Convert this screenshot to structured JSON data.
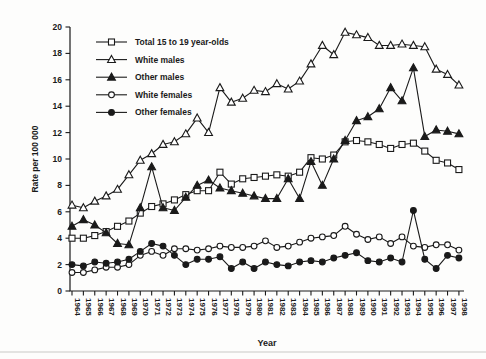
{
  "figure": {
    "ylabel": "Rate per 100 000",
    "xlabel": "Year",
    "background": "#fdfdfc",
    "ink_color": "#1a1a1a",
    "page_rule_color": "#c9c9c5"
  },
  "chart_data": {
    "type": "line",
    "title": "",
    "xlabel": "Year",
    "ylabel": "Rate per 100 000",
    "ylim": [
      0,
      20
    ],
    "y_tick_step": 2,
    "grid": false,
    "legend_position": "upper-left-inside",
    "x": [
      1964,
      1965,
      1966,
      1967,
      1968,
      1969,
      1970,
      1971,
      1972,
      1973,
      1974,
      1975,
      1976,
      1977,
      1978,
      1979,
      1980,
      1981,
      1982,
      1983,
      1984,
      1985,
      1986,
      1987,
      1988,
      1989,
      1990,
      1991,
      1992,
      1993,
      1994,
      1995,
      1996,
      1997,
      1998
    ],
    "series": [
      {
        "id": "total",
        "name": "Total 15 to 19 year-olds",
        "marker": "open-square",
        "values": [
          4.0,
          4.0,
          4.2,
          4.5,
          4.9,
          5.3,
          5.9,
          6.4,
          6.6,
          6.9,
          7.3,
          7.6,
          7.6,
          9.0,
          8.1,
          8.5,
          8.6,
          8.7,
          8.8,
          8.7,
          9.0,
          10.1,
          10.0,
          10.3,
          11.3,
          11.4,
          11.3,
          11.1,
          10.8,
          11.1,
          11.2,
          10.6,
          9.9,
          9.7,
          9.2
        ]
      },
      {
        "id": "white-males",
        "name": "White males",
        "marker": "open-triangle",
        "values": [
          6.5,
          6.3,
          6.8,
          7.2,
          7.7,
          8.8,
          9.9,
          10.4,
          11.1,
          11.3,
          11.9,
          13.1,
          12.0,
          15.4,
          14.3,
          14.6,
          15.2,
          15.1,
          15.7,
          15.3,
          15.9,
          17.2,
          18.6,
          17.9,
          19.6,
          19.4,
          19.2,
          18.6,
          18.6,
          18.7,
          18.6,
          18.5,
          16.8,
          16.4,
          15.6
        ]
      },
      {
        "id": "other-males",
        "name": "Other males",
        "marker": "filled-triangle",
        "values": [
          4.9,
          5.4,
          5.0,
          4.4,
          3.6,
          3.5,
          6.3,
          9.4,
          6.3,
          6.1,
          7.1,
          8.0,
          8.4,
          7.8,
          7.6,
          7.4,
          7.2,
          7.0,
          7.0,
          8.5,
          7.0,
          9.8,
          8.0,
          10.0,
          11.4,
          12.9,
          13.2,
          13.8,
          15.4,
          14.4,
          16.9,
          11.7,
          12.2,
          12.1,
          11.9
        ]
      },
      {
        "id": "white-females",
        "name": "White females",
        "marker": "open-circle",
        "values": [
          1.4,
          1.4,
          1.6,
          1.8,
          1.8,
          2.0,
          2.7,
          3.0,
          2.7,
          3.2,
          3.2,
          3.1,
          3.2,
          3.4,
          3.3,
          3.3,
          3.4,
          3.8,
          3.3,
          3.4,
          3.7,
          4.0,
          4.1,
          4.2,
          4.9,
          4.3,
          3.9,
          4.1,
          3.6,
          4.1,
          3.4,
          3.3,
          3.5,
          3.5,
          3.1
        ]
      },
      {
        "id": "other-females",
        "name": "Other females",
        "marker": "filled-circle",
        "values": [
          2.0,
          1.9,
          2.2,
          2.1,
          2.2,
          2.4,
          3.0,
          3.6,
          3.4,
          2.7,
          2.0,
          2.4,
          2.4,
          2.6,
          1.7,
          2.2,
          1.7,
          2.2,
          2.0,
          1.9,
          2.2,
          2.3,
          2.2,
          2.5,
          2.7,
          2.9,
          2.3,
          2.2,
          2.5,
          2.2,
          6.1,
          2.4,
          1.7,
          2.7,
          2.5
        ]
      }
    ]
  },
  "layout": {
    "width": 486,
    "height": 359,
    "plot": {
      "left": 70,
      "right": 464,
      "top": 27,
      "bottom": 291
    },
    "x_first_tick": 72,
    "x_tick_spacing": 11.38,
    "legend": {
      "x_line1": 96,
      "x_line2": 127,
      "x_text": 135,
      "y_start": 42,
      "y_step": 17.6
    },
    "page_rule_y": 352
  }
}
